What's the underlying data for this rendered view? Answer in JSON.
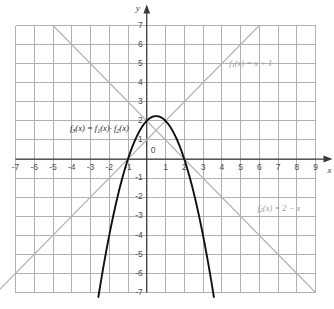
{
  "figure": {
    "kind": "function-graph",
    "background_color": "#ffffff"
  },
  "axes": {
    "x_name": "x",
    "y_name": "y",
    "x_min": -7,
    "x_max": 9,
    "y_min": -7,
    "y_max": 7,
    "x_ticks": [
      -7,
      -6,
      -5,
      -4,
      -3,
      -2,
      -1,
      1,
      2,
      3,
      4,
      5,
      6,
      7,
      8,
      9
    ],
    "y_ticks": [
      7,
      6,
      5,
      4,
      3,
      2,
      1,
      -1,
      -2,
      -3,
      -4,
      -5,
      -6,
      -7
    ],
    "origin_label": "0",
    "grid": true,
    "grid_color": "#a8a8a8",
    "axis_color": "#3a3a3a",
    "tick_color": "#4d4d4d"
  },
  "labels": {
    "f1": {
      "lhs": "f",
      "sub": "1",
      "rest": "(x) = x + 1"
    },
    "f2": {
      "lhs": "f",
      "sub": "2",
      "rest": "(x) = 2 − x"
    },
    "f3": {
      "lhs": "f",
      "sub": "3",
      "rest": "(x) = f",
      "sub_b": "1",
      "mid": "(x)· f",
      "sub_c": "2",
      "tail": "(x)"
    }
  },
  "chart_data": {
    "type": "line",
    "title": "",
    "xlabel": "x",
    "ylabel": "y",
    "xlim": [
      -7,
      9
    ],
    "ylim": [
      -7,
      7
    ],
    "grid": true,
    "legend": "inline-annotations",
    "series": [
      {
        "name": "f1(x) = x + 1",
        "expression": "x + 1",
        "kind": "line",
        "color": "#b3b3b3",
        "slope": 1,
        "intercept": 1,
        "x": [
          -8,
          6
        ],
        "values": [
          -7,
          7
        ],
        "label_text": "f1(x) = x + 1",
        "label_at": [
          4.4,
          5.0
        ]
      },
      {
        "name": "f2(x) = 2 - x",
        "expression": "2 - x",
        "kind": "line",
        "color": "#b3b3b3",
        "slope": -1,
        "intercept": 2,
        "x": [
          -5,
          9
        ],
        "values": [
          7,
          -7
        ],
        "label_text": "f2(x) = 2 - x",
        "label_at": [
          5.9,
          -2.6
        ]
      },
      {
        "name": "f3(x) = f1(x)*f2(x)",
        "expression": "(x + 1)(2 - x) = -x^2 + x + 2",
        "kind": "parabola",
        "color": "#111111",
        "roots": [
          -1,
          2
        ],
        "vertex": [
          0.5,
          2.25
        ],
        "opens": "down",
        "x": [
          -2.58,
          -2,
          -1,
          0,
          0.5,
          1,
          2,
          3,
          3.58
        ],
        "values": [
          -7,
          -4,
          0,
          2,
          2.25,
          2,
          0,
          -4,
          -7
        ],
        "label_text": "f3(x) = f1(x)· f2(x)",
        "label_at": [
          -4.1,
          1.55
        ]
      }
    ],
    "intersections": [
      {
        "point": [
          -1,
          0
        ],
        "note": "f1 zero and f3 root"
      },
      {
        "point": [
          2,
          0
        ],
        "note": "f2 zero and f3 root"
      },
      {
        "point": [
          0.5,
          1.5
        ],
        "note": "f1 meets f2"
      }
    ]
  }
}
